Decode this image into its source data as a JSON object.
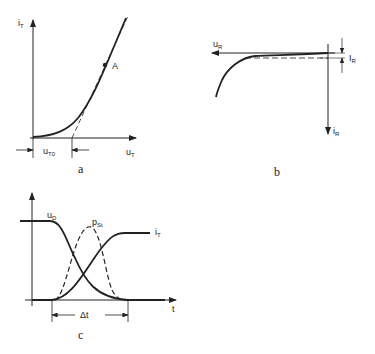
{
  "panel_a": {
    "caption": "a",
    "y_axis_label": "i",
    "y_axis_sub": "T",
    "x_axis_label": "u",
    "x_axis_sub": "T",
    "threshold_label": "u",
    "threshold_sub": "T0",
    "point_label": "A"
  },
  "panel_b": {
    "caption": "b",
    "x_axis_label": "u",
    "x_axis_sub": "R",
    "y_axis_label": "i",
    "y_axis_sub": "R",
    "leakage_label": "I",
    "leakage_sub": "R"
  },
  "panel_c": {
    "caption": "c",
    "voltage_label": "u",
    "voltage_sub": "D",
    "power_label": "p",
    "power_sub": "St",
    "current_label": "i",
    "current_sub": "T",
    "time_axis_label": "t",
    "interval_label": "Δt"
  },
  "colors": {
    "ink": "#222222",
    "background": "#ffffff"
  }
}
